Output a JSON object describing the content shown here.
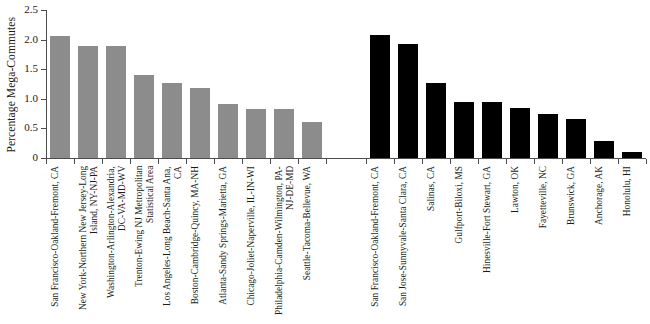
{
  "chart_data": {
    "type": "bar",
    "title": "",
    "subtitle": "",
    "xlabel": "",
    "ylabel": "Percentage Mega-Commutes",
    "ylim": [
      0,
      2.5
    ],
    "ytick_labels": [
      "0",
      "0.5",
      "1.0",
      "1.5",
      "2.0",
      "2.5"
    ],
    "ytick_values": [
      0,
      0.5,
      1.0,
      1.5,
      2.0,
      2.5
    ],
    "grid": false,
    "legend": "none",
    "groups": [
      {
        "name": "group-a",
        "color": "#8c8c8c",
        "categories": [
          "San Francisco-Oakland-Fremont, CA",
          "New York-Northern New Jersey-Long Island, NY-NJ-PA",
          "Washington-Arlington-Alexandria, DC-VA-MD-WV",
          "Trenton-Ewing NJ Metropolitan Statistical Area",
          "Los Angeles-Long Beach-Santa Ana, CA",
          "Boston-Cambridge-Quincy, MA-NH",
          "Atlanta-Sandy Springs-Marietta, GA",
          "Chicago-Joliet-Naperville, IL-IN-WI",
          "Philadelphia-Camden-Wilmington, PA-NJ-DE-MD",
          "Seattle-Tacoma-Bellevue, WA"
        ],
        "values": [
          2.06,
          1.9,
          1.89,
          1.4,
          1.27,
          1.19,
          0.91,
          0.83,
          0.82,
          0.6
        ]
      },
      {
        "name": "group-b",
        "color": "#000000",
        "categories": [
          "San Francisco-Oakland-Fremont, CA",
          "San Jose-Sunnyvale-Santa Clara, CA",
          "Salinas, CA",
          "Gulfport-Biloxi, MS",
          "Hinesville-Fort Stewart, GA",
          "Lawton, OK",
          "Fayetteville, NC",
          "Brunswick, GA",
          "Anchorage, AK",
          "Honolulu, HI"
        ],
        "values": [
          2.08,
          1.93,
          1.27,
          0.95,
          0.94,
          0.85,
          0.75,
          0.66,
          0.28,
          0.1
        ]
      }
    ]
  }
}
